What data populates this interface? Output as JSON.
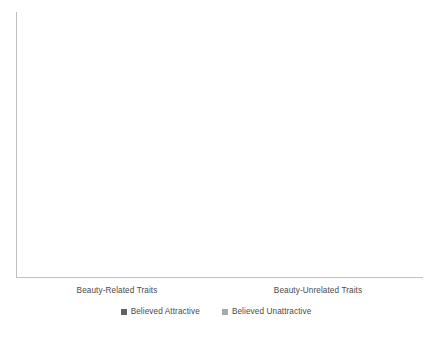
{
  "chart_data": {
    "type": "bar",
    "title": "",
    "subtitle": "",
    "xlabel": "",
    "ylabel": "",
    "grid": false,
    "legend_position": "bottom",
    "axis_ticks": false,
    "categories": [
      "Beauty-Related Traits",
      "Beauty-Unrelated Traits"
    ],
    "series": [
      {
        "name": "Believed Attractive",
        "color": "#626262",
        "values": [
          239,
          136
        ]
      },
      {
        "name": "Believed Unattractive",
        "color": "#a9a9a9",
        "values": [
          34,
          136
        ]
      }
    ],
    "ylim": [
      0,
      265
    ],
    "value_units": "relative (unlabeled axis)",
    "axis_color": "#bfbfbf"
  },
  "legend": {
    "items": [
      {
        "label": "Believed Attractive",
        "color": "#626262"
      },
      {
        "label": "Believed Unattractive",
        "color": "#a9a9a9"
      }
    ]
  },
  "caption": {
    "text": ""
  }
}
